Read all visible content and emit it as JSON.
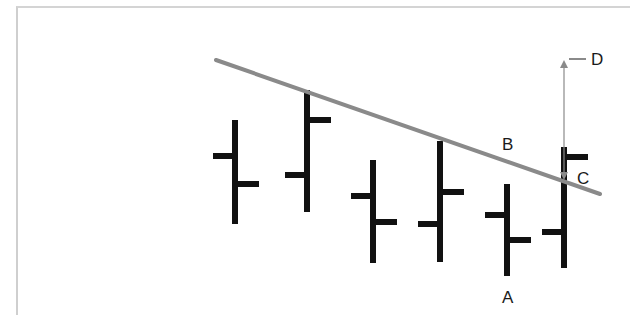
{
  "diagram": {
    "type": "ohlc-bar-chart-with-trendline",
    "colors": {
      "bars": "#111111",
      "trendline": "#8a8a8a",
      "arrow": "#8a8a8a",
      "frame": "#cfcfcf",
      "label": "#1a1a1a"
    },
    "trendline": {
      "x1": 216,
      "y1": 60,
      "x2": 600,
      "y2": 194
    },
    "bars": [
      {
        "x": 235,
        "high": 120,
        "low": 224,
        "open": 156,
        "close": 184
      },
      {
        "x": 307,
        "high": 90,
        "low": 212,
        "open": 175,
        "close": 120
      },
      {
        "x": 373,
        "high": 160,
        "low": 263,
        "open": 196,
        "close": 222
      },
      {
        "x": 440,
        "high": 141,
        "low": 262,
        "open": 224,
        "close": 192
      },
      {
        "x": 507,
        "high": 184,
        "low": 276,
        "open": 215,
        "close": 240
      },
      {
        "x": 564,
        "high": 147,
        "low": 268,
        "open": 232,
        "close": 157
      }
    ],
    "labels": {
      "A": "A",
      "B": "B",
      "C": "C",
      "D": "D"
    }
  }
}
